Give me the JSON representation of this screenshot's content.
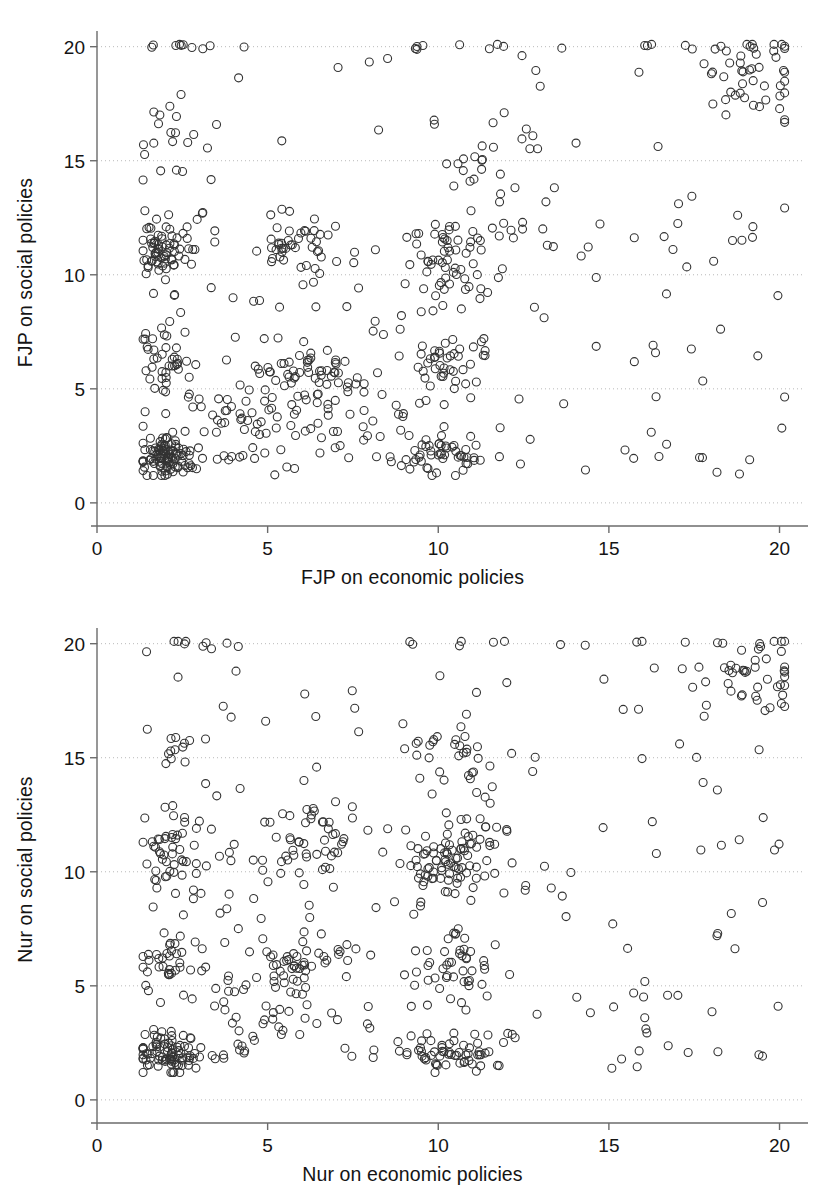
{
  "figure": {
    "background": "#ffffff",
    "marker_color": "#333333",
    "gridline_color": "#b9b9b9",
    "axis_color": "#6b6b6b",
    "width": 825,
    "height": 1193
  },
  "chart_data": [
    {
      "type": "scatter",
      "panel": "top",
      "title": "",
      "xlabel": "FJP on economic policies",
      "ylabel": "FJP on social policies",
      "xlim": [
        0,
        20.6
      ],
      "ylim": [
        -0.4,
        20.6
      ],
      "xticks": [
        0,
        5,
        10,
        15,
        20
      ],
      "yticks": [
        0,
        5,
        10,
        15,
        20
      ],
      "xticklabels": [
        "0",
        "5",
        "10",
        "15",
        "20"
      ],
      "yticklabels": [
        "0",
        "5",
        "10",
        "15",
        "20"
      ],
      "grid": "horizontal-dotted",
      "legend": "none",
      "marker": "open-circle",
      "marker_size": 8,
      "n_points": 740,
      "clusters": [
        {
          "cx": 2.0,
          "cy": 2.0,
          "n": 95,
          "sx": 0.38,
          "sy": 0.45
        },
        {
          "cx": 2.0,
          "cy": 11.0,
          "n": 55,
          "sx": 0.35,
          "sy": 0.6
        },
        {
          "cx": 2.0,
          "cy": 6.0,
          "n": 30,
          "sx": 0.35,
          "sy": 0.7
        },
        {
          "cx": 6.0,
          "cy": 11.2,
          "n": 40,
          "sx": 0.55,
          "sy": 0.8
        },
        {
          "cx": 6.3,
          "cy": 6.0,
          "n": 48,
          "sx": 0.85,
          "sy": 0.7
        },
        {
          "cx": 10.3,
          "cy": 10.8,
          "n": 55,
          "sx": 0.75,
          "sy": 1.0
        },
        {
          "cx": 10.2,
          "cy": 6.1,
          "n": 40,
          "sx": 0.6,
          "sy": 0.7
        },
        {
          "cx": 10.3,
          "cy": 2.0,
          "n": 42,
          "sx": 0.7,
          "sy": 0.5
        },
        {
          "cx": 19.2,
          "cy": 18.6,
          "n": 42,
          "sx": 0.8,
          "sy": 1.1
        },
        {
          "cx": 7.2,
          "cy": 4.0,
          "n": 30,
          "sx": 1.2,
          "sy": 0.8
        },
        {
          "cx": 4.2,
          "cy": 3.2,
          "n": 26,
          "sx": 1.0,
          "sy": 1.0
        },
        {
          "cx": 2.2,
          "cy": 15.5,
          "n": 22,
          "sx": 0.5,
          "sy": 1.6
        },
        {
          "cx": 11.5,
          "cy": 14.8,
          "n": 26,
          "sx": 0.9,
          "sy": 1.2
        }
      ],
      "scatter_background": {
        "n": 190,
        "x_range": [
          1.4,
          20.2
        ],
        "y_range": [
          1.2,
          20.2
        ]
      },
      "edge_rows": [
        {
          "y": 20.0,
          "n": 24
        },
        {
          "y": 2.0,
          "n": 18
        }
      ]
    },
    {
      "type": "scatter",
      "panel": "bottom",
      "title": "",
      "xlabel": "Nur on economic policies",
      "ylabel": "Nur on social policies",
      "xlim": [
        0,
        20.6
      ],
      "ylim": [
        -0.4,
        20.6
      ],
      "xticks": [
        0,
        5,
        10,
        15,
        20
      ],
      "yticks": [
        0,
        5,
        10,
        15,
        20
      ],
      "xticklabels": [
        "0",
        "5",
        "10",
        "15",
        "20"
      ],
      "yticklabels": [
        "0",
        "5",
        "10",
        "15",
        "20"
      ],
      "grid": "horizontal-dotted",
      "legend": "none",
      "marker": "open-circle",
      "marker_size": 8,
      "n_points": 720,
      "clusters": [
        {
          "cx": 2.0,
          "cy": 2.1,
          "n": 80,
          "sx": 0.45,
          "sy": 0.5
        },
        {
          "cx": 2.1,
          "cy": 11.0,
          "n": 38,
          "sx": 0.4,
          "sy": 0.7
        },
        {
          "cx": 2.0,
          "cy": 6.0,
          "n": 26,
          "sx": 0.35,
          "sy": 0.6
        },
        {
          "cx": 6.1,
          "cy": 11.3,
          "n": 38,
          "sx": 0.6,
          "sy": 0.8
        },
        {
          "cx": 6.0,
          "cy": 6.1,
          "n": 44,
          "sx": 0.7,
          "sy": 0.7
        },
        {
          "cx": 10.1,
          "cy": 10.0,
          "n": 48,
          "sx": 0.6,
          "sy": 0.6
        },
        {
          "cx": 10.6,
          "cy": 11.2,
          "n": 36,
          "sx": 0.7,
          "sy": 0.8
        },
        {
          "cx": 10.2,
          "cy": 6.3,
          "n": 40,
          "sx": 0.7,
          "sy": 0.9
        },
        {
          "cx": 10.4,
          "cy": 2.1,
          "n": 44,
          "sx": 0.8,
          "sy": 0.5
        },
        {
          "cx": 19.2,
          "cy": 18.7,
          "n": 44,
          "sx": 0.9,
          "sy": 1.1
        },
        {
          "cx": 10.6,
          "cy": 14.8,
          "n": 28,
          "sx": 1.0,
          "sy": 0.9
        },
        {
          "cx": 5.5,
          "cy": 3.6,
          "n": 26,
          "sx": 1.1,
          "sy": 0.9
        },
        {
          "cx": 2.3,
          "cy": 15.3,
          "n": 12,
          "sx": 0.4,
          "sy": 0.35
        }
      ],
      "scatter_background": {
        "n": 200,
        "x_range": [
          1.4,
          20.2
        ],
        "y_range": [
          1.2,
          20.2
        ]
      },
      "edge_rows": [
        {
          "y": 20.0,
          "n": 22
        },
        {
          "y": 2.0,
          "n": 22
        }
      ]
    }
  ]
}
